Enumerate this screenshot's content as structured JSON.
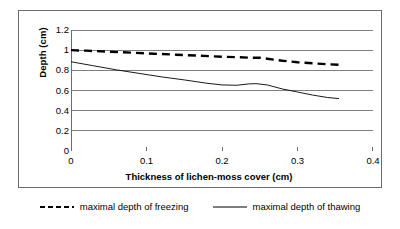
{
  "figure": {
    "frame_color": "#6b6b6b",
    "background": "#ffffff"
  },
  "chart_data": {
    "type": "line",
    "title": "",
    "subtitle": "",
    "xlabel": "Thickness of lichen-moss cover (cm)",
    "ylabel": "Depth (cm)",
    "xlim": [
      0,
      0.4
    ],
    "ylim": [
      0,
      1.2
    ],
    "xticks": [
      0,
      0.1,
      0.2,
      0.3,
      0.4
    ],
    "xtick_labels": [
      "0",
      "0.1",
      "0.2",
      "0.3",
      "0.4"
    ],
    "yticks": [
      0,
      0.2,
      0.4,
      0.6,
      0.8,
      1,
      1.2
    ],
    "ytick_labels": [
      "0",
      "0.2",
      "0.4",
      "0.6",
      "0.8",
      "1",
      "1.2"
    ],
    "grid": "horizontal",
    "grid_color": "#808080",
    "legend_position": "below-outside",
    "series": [
      {
        "name": "maximal depth of freezing",
        "style": "dashed",
        "color": "#000000",
        "width": 2.4,
        "x": [
          0.0,
          0.02,
          0.05,
          0.08,
          0.11,
          0.14,
          0.17,
          0.2,
          0.22,
          0.24,
          0.25,
          0.26,
          0.28,
          0.3,
          0.32,
          0.34,
          0.355
        ],
        "y": [
          1.0,
          0.995,
          0.985,
          0.975,
          0.965,
          0.955,
          0.945,
          0.935,
          0.93,
          0.925,
          0.925,
          0.915,
          0.895,
          0.88,
          0.87,
          0.86,
          0.855
        ]
      },
      {
        "name": "maximal depth of thawing",
        "style": "solid",
        "color": "#000000",
        "width": 0.9,
        "x": [
          0.0,
          0.03,
          0.06,
          0.09,
          0.12,
          0.15,
          0.18,
          0.2,
          0.22,
          0.235,
          0.245,
          0.26,
          0.28,
          0.3,
          0.32,
          0.34,
          0.355
        ],
        "y": [
          0.885,
          0.845,
          0.805,
          0.77,
          0.735,
          0.705,
          0.672,
          0.655,
          0.652,
          0.665,
          0.668,
          0.655,
          0.615,
          0.585,
          0.555,
          0.53,
          0.52
        ]
      }
    ]
  },
  "legend": {
    "items": [
      {
        "label": "maximal depth of freezing",
        "style": "dashed"
      },
      {
        "label": "maximal depth of thawing",
        "style": "solid"
      }
    ]
  }
}
